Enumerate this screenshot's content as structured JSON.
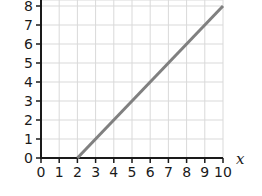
{
  "chart_data": {
    "type": "line",
    "title": "",
    "xlabel": "x",
    "ylabel": "",
    "xlim": [
      0,
      10
    ],
    "ylim": [
      0,
      8
    ],
    "x_ticks": [
      "0",
      "1",
      "2",
      "3",
      "4",
      "5",
      "6",
      "7",
      "8",
      "9",
      "10"
    ],
    "y_ticks": [
      "0",
      "1",
      "2",
      "3",
      "4",
      "5",
      "6",
      "7",
      "8"
    ],
    "grid": true,
    "legend": null,
    "series": [
      {
        "name": "line",
        "x": [
          2,
          10
        ],
        "y": [
          0,
          8
        ],
        "color": "#808080"
      }
    ]
  },
  "colors": {
    "grid": "#d9d9d9",
    "axis": "#1a1a1a",
    "line": "#808080"
  }
}
